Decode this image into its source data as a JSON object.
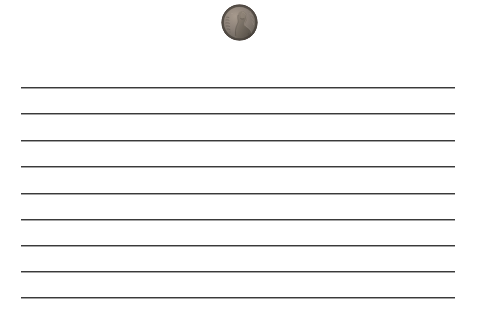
{
  "scene": {
    "width": 477,
    "height": 315,
    "background_color": "#ffffff",
    "description": "Ruled notebook paper with a US one-cent coin placed near the top center as a scale reference"
  },
  "paper": {
    "name": "ruled-paper-sheet",
    "line_color": "#3a3a3a",
    "line_shadow_color": "#5a5a5a",
    "line_thickness_px": 1,
    "line_left_px": 21,
    "line_right_px": 455,
    "line_count": 9,
    "line_y_positions": [
      87,
      113,
      140,
      166,
      193,
      219,
      245,
      271,
      297
    ]
  },
  "coin": {
    "name": "penny-coin",
    "label": "US one cent (Lincoln penny), obverse",
    "center_x": 239,
    "center_y": 22,
    "diameter_px": 37,
    "rim_color": "#6d6a64",
    "field_color": "#8d8279",
    "shadow_color": "#4a453f",
    "highlight_color": "#b3a79a",
    "relief_color": "#5c554e"
  }
}
